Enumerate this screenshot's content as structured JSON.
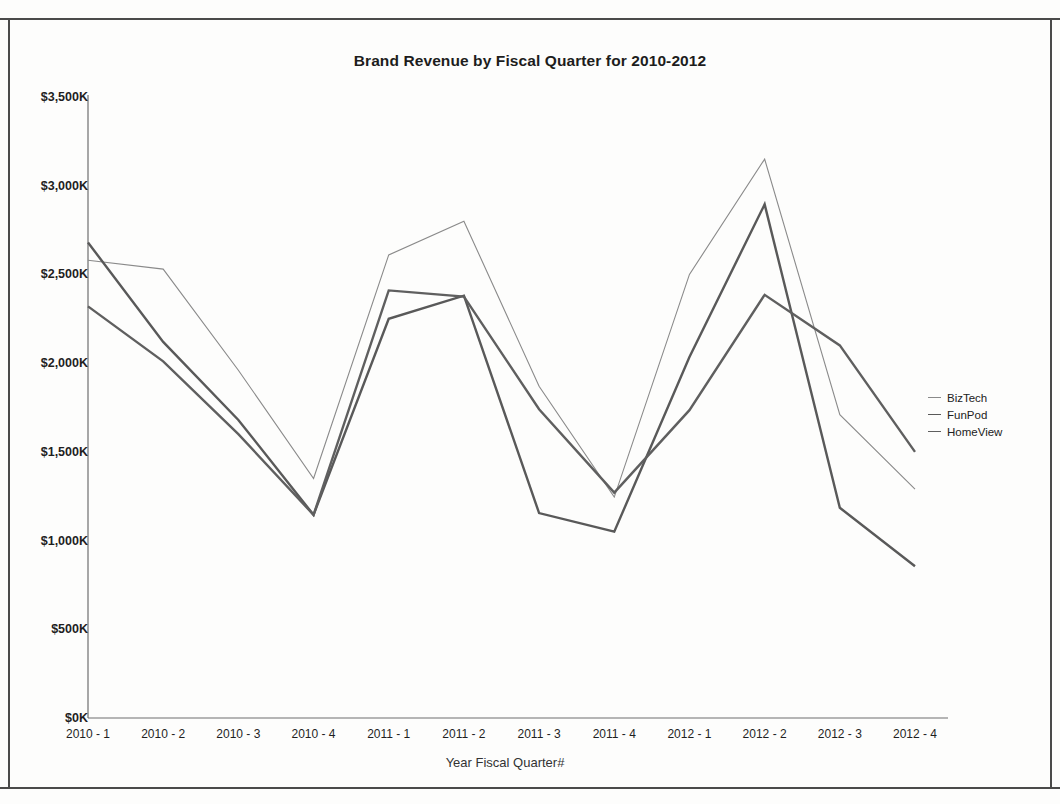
{
  "chart_data": {
    "type": "line",
    "title": "Brand Revenue by Fiscal Quarter for 2010-2012",
    "xlabel": "Year Fiscal Quarter#",
    "ylabel": "",
    "grid": false,
    "legend_position": "right",
    "ylim": [
      0,
      3500
    ],
    "ytick_values": [
      0,
      500,
      1000,
      1500,
      2000,
      2500,
      3000,
      3500
    ],
    "ytick_labels": [
      "$0K",
      "$500K",
      "$1,000K",
      "$1,500K",
      "$2,000K",
      "$2,500K",
      "$3,000K",
      "$3,500K"
    ],
    "categories": [
      "2010 - 1",
      "2010 - 2",
      "2010 - 3",
      "2010 - 4",
      "2011 - 1",
      "2011 - 2",
      "2011 - 3",
      "2011 - 4",
      "2012 - 1",
      "2012 - 2",
      "2012 - 3",
      "2012 - 4"
    ],
    "series": [
      {
        "name": "BizTech",
        "color": "#8a8a8a",
        "width": 1.1,
        "values": [
          2580,
          2530,
          1960,
          1350,
          2610,
          2800,
          1870,
          1245,
          2500,
          3150,
          1710,
          1290
        ]
      },
      {
        "name": "FunPod",
        "color": "#595959",
        "width": 2.4,
        "values": [
          2680,
          2120,
          1680,
          1145,
          2250,
          2380,
          1155,
          1050,
          2035,
          2895,
          1185,
          855
        ]
      },
      {
        "name": "HomeView",
        "color": "#5f5f5f",
        "width": 2.4,
        "values": [
          2320,
          2010,
          1600,
          1145,
          2410,
          2375,
          1740,
          1270,
          1735,
          2385,
          2100,
          1500
        ]
      }
    ]
  },
  "legend": {
    "items": [
      {
        "label": "BizTech"
      },
      {
        "label": "FunPod"
      },
      {
        "label": "HomeView"
      }
    ]
  }
}
